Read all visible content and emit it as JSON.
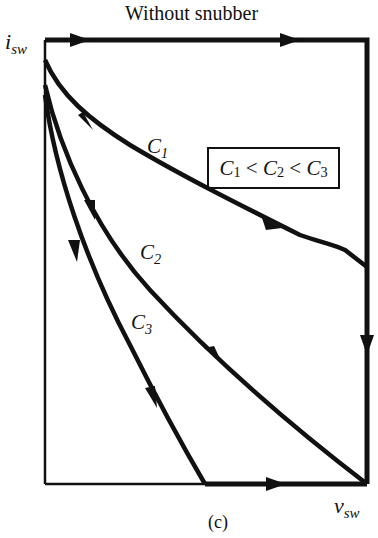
{
  "title": "Without snubber",
  "axes": {
    "y_label": "i",
    "y_sub": "sw",
    "x_label": "v",
    "x_sub": "sw"
  },
  "curves": [
    {
      "name": "C",
      "sub": "1"
    },
    {
      "name": "C",
      "sub": "2"
    },
    {
      "name": "C",
      "sub": "3"
    }
  ],
  "inequality": {
    "c1": "C",
    "s1": "1",
    "op1": " < ",
    "c2": "C",
    "s2": "2",
    "op2": " < ",
    "c3": "C",
    "s3": "3"
  },
  "caption": "(c)",
  "colors": {
    "ink": "#111111",
    "background": "#ffffff"
  }
}
